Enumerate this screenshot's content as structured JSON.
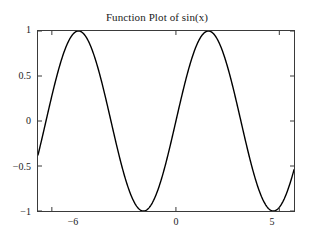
{
  "chart_data": {
    "type": "line",
    "title": "Function Plot of sin(x)",
    "xlabel": "",
    "ylabel": "",
    "function": "sin(x)",
    "xlim": [
      -6.67,
      5.71
    ],
    "ylim": [
      -1,
      1
    ],
    "grid": false,
    "legend": null,
    "line_color": "#000000",
    "line_width": 1.4,
    "xticks": [
      -6,
      0,
      5
    ],
    "xtick_labels": [
      "−6",
      "0",
      "5"
    ],
    "yticks": [
      -1,
      -0.5,
      0,
      0.5,
      1
    ],
    "ytick_labels": [
      "−1",
      "−0.5",
      "0",
      "0.5",
      "1"
    ],
    "series": [
      {
        "name": "sin(x)",
        "x": [
          -6.67,
          -6.54,
          -6.42,
          -6.29,
          -6.17,
          -6.04,
          -5.92,
          -5.79,
          -5.67,
          -5.54,
          -5.42,
          -5.29,
          -5.17,
          -5.04,
          -4.92,
          -4.79,
          -4.67,
          -4.54,
          -4.42,
          -4.29,
          -4.17,
          -4.04,
          -3.92,
          -3.79,
          -3.67,
          -3.54,
          -3.42,
          -3.29,
          -3.17,
          -3.04,
          -2.92,
          -2.79,
          -2.67,
          -2.54,
          -2.42,
          -2.29,
          -2.17,
          -2.04,
          -1.92,
          -1.79,
          -1.67,
          -1.54,
          -1.42,
          -1.29,
          -1.17,
          -1.04,
          -0.92,
          -0.79,
          -0.67,
          -0.54,
          -0.42,
          -0.29,
          -0.17,
          -0.04,
          0.08,
          0.21,
          0.33,
          0.46,
          0.58,
          0.71,
          0.83,
          0.96,
          1.08,
          1.21,
          1.33,
          1.46,
          1.58,
          1.71,
          1.83,
          1.96,
          2.08,
          2.21,
          2.33,
          2.46,
          2.58,
          2.71,
          2.83,
          2.96,
          3.08,
          3.21,
          3.33,
          3.46,
          3.58,
          3.71,
          3.83,
          3.96,
          4.08,
          4.21,
          4.33,
          4.46,
          4.58,
          4.71,
          4.83,
          4.96,
          5.08,
          5.21,
          5.33,
          5.46,
          5.58,
          5.71
        ],
        "y": [
          -0.37,
          -0.25,
          -0.13,
          -0.01,
          0.11,
          0.23,
          0.34,
          0.45,
          0.55,
          0.69,
          0.77,
          0.84,
          0.9,
          0.94,
          0.98,
          1.0,
          1.0,
          0.99,
          0.96,
          0.92,
          0.86,
          0.79,
          0.71,
          0.61,
          0.5,
          0.39,
          0.28,
          0.15,
          0.03,
          -0.1,
          -0.22,
          -0.34,
          -0.45,
          -0.56,
          -0.66,
          -0.75,
          -0.82,
          -0.89,
          -0.94,
          -0.98,
          -1.0,
          -1.0,
          -0.99,
          -0.96,
          -0.92,
          -0.86,
          -0.8,
          -0.71,
          -0.62,
          -0.51,
          -0.41,
          -0.29,
          -0.17,
          -0.04,
          0.08,
          0.21,
          0.32,
          0.44,
          0.55,
          0.65,
          0.74,
          0.82,
          0.88,
          0.94,
          0.97,
          0.99,
          1.0,
          0.99,
          0.97,
          0.92,
          0.87,
          0.8,
          0.72,
          0.63,
          0.53,
          0.42,
          0.3,
          0.18,
          0.06,
          -0.07,
          -0.19,
          -0.31,
          -0.43,
          -0.54,
          -0.63,
          -0.73,
          -0.81,
          -0.88,
          -0.93,
          -0.97,
          -0.99,
          -1.0,
          -0.99,
          -0.96,
          -0.92,
          -0.87,
          -0.81,
          -0.71,
          -0.62,
          -0.52
        ]
      }
    ]
  },
  "axes": {
    "title": "Function Plot of sin(x)",
    "x_tick_labels": [
      "−6",
      "0",
      "5"
    ],
    "y_tick_labels": [
      "1",
      "0.5",
      "0",
      "−0.5",
      "−1"
    ]
  }
}
